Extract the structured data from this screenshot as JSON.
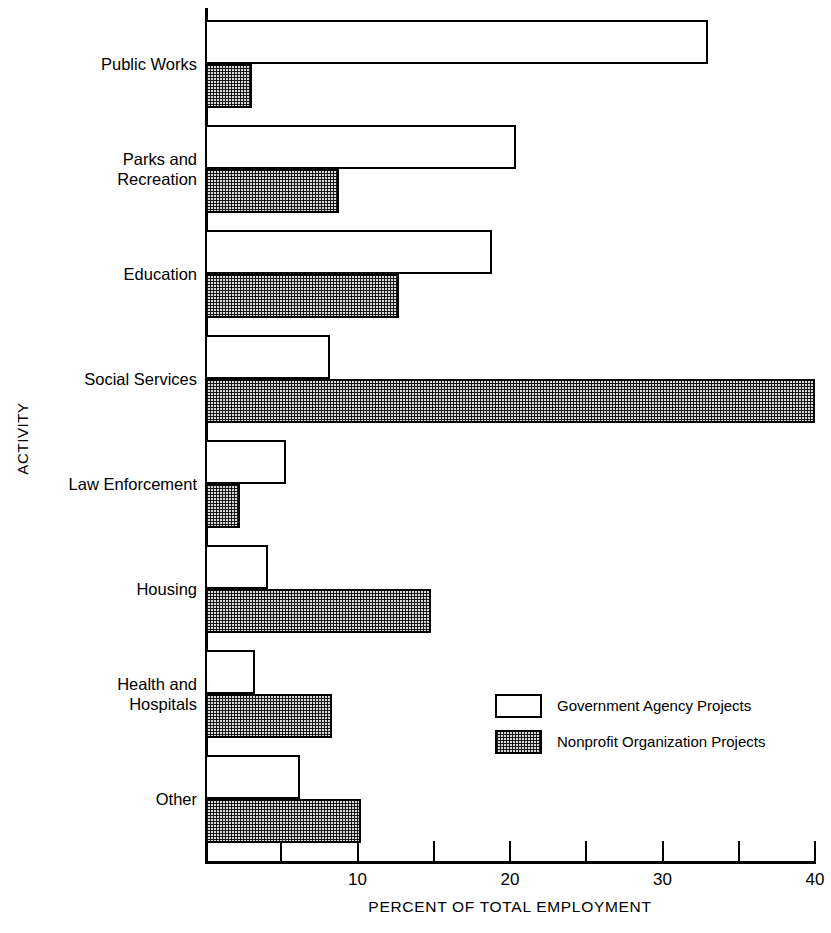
{
  "chart_data": {
    "type": "bar",
    "orientation": "horizontal",
    "grouped": true,
    "title": "",
    "xlabel": "PERCENT OF TOTAL EMPLOYMENT",
    "ylabel": "ACTIVITY",
    "xlim": [
      0,
      40
    ],
    "xticks": [
      0,
      5,
      10,
      15,
      20,
      25,
      30,
      35,
      40
    ],
    "xtick_labels": [
      "",
      "",
      "10",
      "",
      "20",
      "",
      "30",
      "",
      "40"
    ],
    "grid": false,
    "legend_position": "inside-lower-right",
    "categories": [
      "Public Works",
      "Parks and Recreation",
      "Education",
      "Social Services",
      "Law Enforcement",
      "Housing",
      "Health and Hospitals",
      "Other"
    ],
    "category_label_lines": [
      [
        "Public Works"
      ],
      [
        "Parks and",
        "Recreation"
      ],
      [
        "Education"
      ],
      [
        "Social Services"
      ],
      [
        "Law Enforcement"
      ],
      [
        "Housing"
      ],
      [
        "Health and",
        "Hospitals"
      ],
      [
        "Other"
      ]
    ],
    "series": [
      {
        "name": "Government Agency Projects",
        "style": "white",
        "values": [
          33.0,
          20.4,
          18.8,
          8.2,
          5.3,
          4.1,
          3.3,
          6.2
        ]
      },
      {
        "name": "Nonprofit Organization Projects",
        "style": "hatched",
        "values": [
          3.1,
          8.8,
          12.7,
          40.0,
          2.3,
          14.8,
          8.3,
          10.2
        ]
      }
    ]
  },
  "legend": {
    "entries": [
      {
        "label": "Government Agency Projects",
        "swatch": "white-box-swatch"
      },
      {
        "label": "Nonprofit Organization Projects",
        "swatch": "hatched-box-swatch"
      }
    ]
  },
  "colors": {
    "ink": "#000000",
    "background": "#ffffff",
    "hatch_fill": "#d8d8d8"
  }
}
